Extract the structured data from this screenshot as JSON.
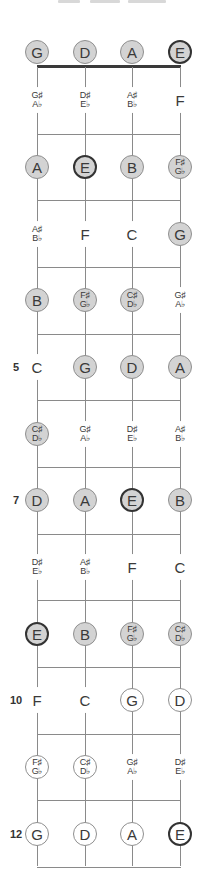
{
  "diagram": {
    "type": "fretboard",
    "instrument_tuning": [
      "G",
      "D",
      "A",
      "E"
    ],
    "colors": {
      "filled": "#d3d3d3",
      "open_circle": "#ffffff",
      "bold_outline": "#333333",
      "line": "#8a8a8a",
      "nut": "#3a3a3a"
    },
    "fret_markers": [
      {
        "fret": 5,
        "label": "5"
      },
      {
        "fret": 7,
        "label": "7"
      },
      {
        "fret": 10,
        "label": "10"
      },
      {
        "fret": 12,
        "label": "12"
      }
    ],
    "rows": [
      {
        "fret": 0,
        "notes": [
          {
            "t1": "G",
            "style": "filled"
          },
          {
            "t1": "D",
            "style": "filled"
          },
          {
            "t1": "A",
            "style": "filled"
          },
          {
            "t1": "E",
            "style": "filled bold"
          }
        ]
      },
      {
        "fret": 1,
        "notes": [
          {
            "t1": "G♯",
            "t2": "A♭",
            "style": "text"
          },
          {
            "t1": "D♯",
            "t2": "E♭",
            "style": "text"
          },
          {
            "t1": "A♯",
            "t2": "B♭",
            "style": "text"
          },
          {
            "t1": "F",
            "style": "text"
          }
        ]
      },
      {
        "fret": 2,
        "notes": [
          {
            "t1": "A",
            "style": "filled"
          },
          {
            "t1": "E",
            "style": "filled bold"
          },
          {
            "t1": "B",
            "style": "filled"
          },
          {
            "t1": "F♯",
            "t2": "G♭",
            "style": "filled"
          }
        ]
      },
      {
        "fret": 3,
        "notes": [
          {
            "t1": "A♯",
            "t2": "B♭",
            "style": "text"
          },
          {
            "t1": "F",
            "style": "text"
          },
          {
            "t1": "C",
            "style": "text"
          },
          {
            "t1": "G",
            "style": "filled"
          }
        ]
      },
      {
        "fret": 4,
        "notes": [
          {
            "t1": "B",
            "style": "filled"
          },
          {
            "t1": "F♯",
            "t2": "G♭",
            "style": "filled"
          },
          {
            "t1": "C♯",
            "t2": "D♭",
            "style": "filled"
          },
          {
            "t1": "G♯",
            "t2": "A♭",
            "style": "text"
          }
        ]
      },
      {
        "fret": 5,
        "notes": [
          {
            "t1": "C",
            "style": "text"
          },
          {
            "t1": "G",
            "style": "filled"
          },
          {
            "t1": "D",
            "style": "filled"
          },
          {
            "t1": "A",
            "style": "filled"
          }
        ]
      },
      {
        "fret": 6,
        "notes": [
          {
            "t1": "C♯",
            "t2": "D♭",
            "style": "filled"
          },
          {
            "t1": "G♯",
            "t2": "A♭",
            "style": "text"
          },
          {
            "t1": "D♯",
            "t2": "E♭",
            "style": "text"
          },
          {
            "t1": "A♯",
            "t2": "B♭",
            "style": "text"
          }
        ]
      },
      {
        "fret": 7,
        "notes": [
          {
            "t1": "D",
            "style": "filled"
          },
          {
            "t1": "A",
            "style": "filled"
          },
          {
            "t1": "E",
            "style": "filled bold"
          },
          {
            "t1": "B",
            "style": "filled"
          }
        ]
      },
      {
        "fret": 8,
        "notes": [
          {
            "t1": "D♯",
            "t2": "E♭",
            "style": "text"
          },
          {
            "t1": "A♯",
            "t2": "B♭",
            "style": "text"
          },
          {
            "t1": "F",
            "style": "text"
          },
          {
            "t1": "C",
            "style": "text"
          }
        ]
      },
      {
        "fret": 9,
        "notes": [
          {
            "t1": "E",
            "style": "filled bold"
          },
          {
            "t1": "B",
            "style": "filled"
          },
          {
            "t1": "F♯",
            "t2": "G♭",
            "style": "filled"
          },
          {
            "t1": "C♯",
            "t2": "D♭",
            "style": "filled"
          }
        ]
      },
      {
        "fret": 10,
        "notes": [
          {
            "t1": "F",
            "style": "text"
          },
          {
            "t1": "C",
            "style": "text"
          },
          {
            "t1": "G",
            "style": "open"
          },
          {
            "t1": "D",
            "style": "open"
          }
        ]
      },
      {
        "fret": 11,
        "notes": [
          {
            "t1": "F♯",
            "t2": "G♭",
            "style": "open"
          },
          {
            "t1": "C♯",
            "t2": "D♭",
            "style": "open"
          },
          {
            "t1": "G♯",
            "t2": "A♭",
            "style": "text"
          },
          {
            "t1": "D♯",
            "t2": "E♭",
            "style": "text"
          }
        ]
      },
      {
        "fret": 12,
        "notes": [
          {
            "t1": "G",
            "style": "open"
          },
          {
            "t1": "D",
            "style": "open"
          },
          {
            "t1": "A",
            "style": "open"
          },
          {
            "t1": "E",
            "style": "open bold"
          }
        ]
      }
    ]
  }
}
